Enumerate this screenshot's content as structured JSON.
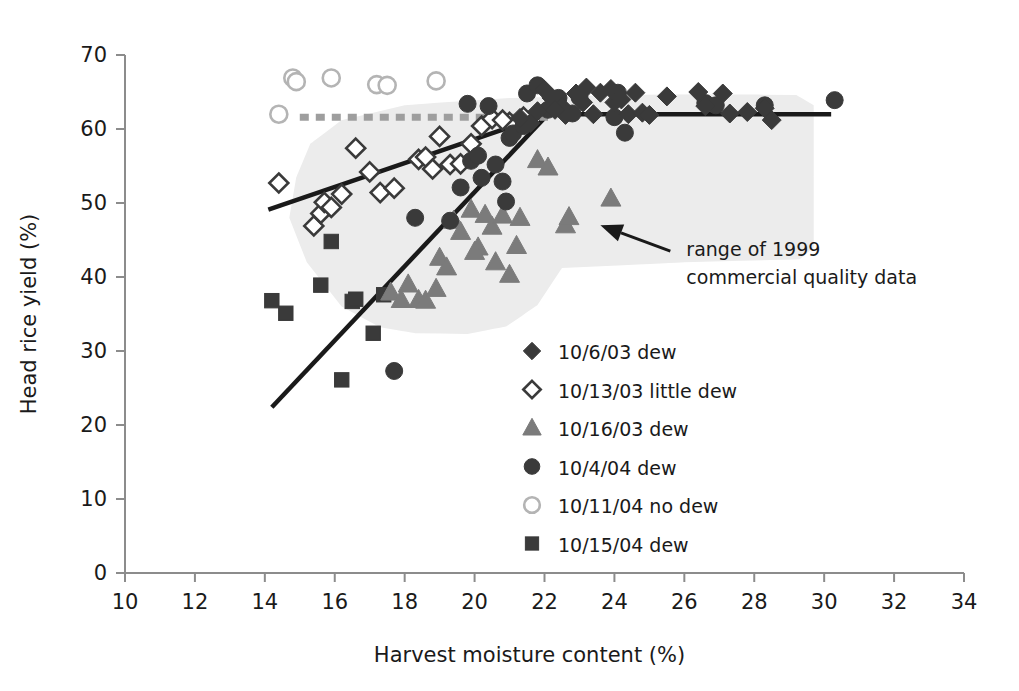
{
  "chart_data": {
    "type": "scatter",
    "title": "",
    "xlabel": "Harvest moisture content (%)",
    "ylabel": "Head rice yield (%)",
    "xlim": [
      10,
      34
    ],
    "ylim": [
      0,
      70
    ],
    "xticks": [
      10,
      12,
      14,
      16,
      18,
      20,
      22,
      24,
      26,
      28,
      30,
      32,
      34
    ],
    "yticks": [
      0,
      10,
      20,
      30,
      40,
      50,
      60,
      70
    ],
    "grid": false,
    "legend_position": "center",
    "colors": {
      "dark_marker": "#3a3a3a",
      "mid_marker": "#7b7b7b",
      "light_outline": "#b4b4b4",
      "open_fill": "#ffffff",
      "shaded_region": "#ececec",
      "trend_line": "#1a1a1a",
      "dashed_line": "#9e9e9e",
      "axis": "#8c8c8c",
      "text": "#1a1a1a"
    },
    "series": [
      {
        "name": "10/6/03 dew",
        "marker": "filled-diamond",
        "color": "#3a3a3a",
        "points": [
          [
            21.6,
            60.8
          ],
          [
            21.8,
            62.4
          ],
          [
            22.0,
            65.3
          ],
          [
            22.2,
            64.2
          ],
          [
            22.5,
            63.0
          ],
          [
            22.6,
            61.9
          ],
          [
            22.9,
            64.8
          ],
          [
            23.1,
            63.6
          ],
          [
            23.4,
            62.0
          ],
          [
            23.6,
            64.9
          ],
          [
            23.9,
            65.4
          ],
          [
            24.0,
            63.6
          ],
          [
            24.2,
            64.0
          ],
          [
            24.4,
            62.0
          ],
          [
            24.6,
            64.9
          ],
          [
            25.5,
            64.4
          ],
          [
            26.4,
            65.0
          ],
          [
            26.6,
            63.1
          ],
          [
            27.1,
            64.8
          ],
          [
            27.3,
            62.1
          ],
          [
            28.3,
            62.8
          ],
          [
            28.5,
            61.2
          ],
          [
            21.3,
            61.5
          ],
          [
            22.3,
            62.6
          ],
          [
            23.2,
            65.6
          ],
          [
            24.8,
            62.2
          ],
          [
            25.0,
            61.9
          ],
          [
            27.8,
            62.3
          ]
        ]
      },
      {
        "name": "10/13/03 little dew",
        "marker": "open-diamond",
        "color": "#3a3a3a",
        "points": [
          [
            14.4,
            52.7
          ],
          [
            15.4,
            46.9
          ],
          [
            15.6,
            48.6
          ],
          [
            15.7,
            50.1
          ],
          [
            15.9,
            49.4
          ],
          [
            16.2,
            51.2
          ],
          [
            16.6,
            57.4
          ],
          [
            17.0,
            54.2
          ],
          [
            17.3,
            51.4
          ],
          [
            17.7,
            52.0
          ],
          [
            18.4,
            55.9
          ],
          [
            18.6,
            56.2
          ],
          [
            18.8,
            54.6
          ],
          [
            19.0,
            59.0
          ],
          [
            19.3,
            55.2
          ],
          [
            19.6,
            55.3
          ],
          [
            20.2,
            60.4
          ],
          [
            20.5,
            61.4
          ],
          [
            21.0,
            60.9
          ],
          [
            21.4,
            61.6
          ],
          [
            19.9,
            58.0
          ],
          [
            20.8,
            61.2
          ]
        ]
      },
      {
        "name": "10/16/03 dew",
        "marker": "filled-triangle",
        "color": "#7b7b7b",
        "points": [
          [
            17.6,
            37.9
          ],
          [
            18.4,
            36.9
          ],
          [
            18.6,
            36.8
          ],
          [
            19.0,
            42.6
          ],
          [
            19.4,
            47.6
          ],
          [
            19.6,
            46.1
          ],
          [
            19.9,
            49.1
          ],
          [
            20.1,
            44.0
          ],
          [
            20.3,
            48.4
          ],
          [
            20.5,
            46.8
          ],
          [
            20.8,
            48.3
          ],
          [
            21.0,
            40.3
          ],
          [
            21.3,
            48.0
          ],
          [
            21.8,
            55.8
          ],
          [
            22.1,
            54.8
          ],
          [
            18.1,
            39.0
          ],
          [
            19.2,
            41.3
          ],
          [
            20.0,
            43.4
          ],
          [
            17.9,
            36.9
          ],
          [
            21.2,
            44.2
          ],
          [
            23.9,
            50.6
          ],
          [
            22.6,
            47.0
          ],
          [
            22.7,
            48.1
          ],
          [
            20.6,
            42.0
          ],
          [
            18.9,
            38.4
          ]
        ]
      },
      {
        "name": "10/4/04 dew",
        "marker": "filled-circle",
        "color": "#3a3a3a",
        "points": [
          [
            17.7,
            27.3
          ],
          [
            18.3,
            48.0
          ],
          [
            19.3,
            47.6
          ],
          [
            19.6,
            52.1
          ],
          [
            19.8,
            63.4
          ],
          [
            19.9,
            55.7
          ],
          [
            20.1,
            56.4
          ],
          [
            20.2,
            53.4
          ],
          [
            20.4,
            63.1
          ],
          [
            20.6,
            55.2
          ],
          [
            20.8,
            52.9
          ],
          [
            21.0,
            58.8
          ],
          [
            21.1,
            59.4
          ],
          [
            21.4,
            60.4
          ],
          [
            21.5,
            64.8
          ],
          [
            21.8,
            65.9
          ],
          [
            22.1,
            62.6
          ],
          [
            22.4,
            64.2
          ],
          [
            23.0,
            64.3
          ],
          [
            24.0,
            61.6
          ],
          [
            24.1,
            64.9
          ],
          [
            26.6,
            63.5
          ],
          [
            26.9,
            63.2
          ],
          [
            28.3,
            63.2
          ],
          [
            30.3,
            63.9
          ],
          [
            20.9,
            50.2
          ],
          [
            22.8,
            62.1
          ],
          [
            24.3,
            59.5
          ]
        ]
      },
      {
        "name": "10/11/04 no dew",
        "marker": "open-circle",
        "color": "#b4b4b4",
        "points": [
          [
            14.4,
            62.0
          ],
          [
            14.8,
            66.9
          ],
          [
            14.9,
            66.4
          ],
          [
            15.9,
            66.9
          ],
          [
            17.2,
            66.0
          ],
          [
            17.5,
            65.9
          ],
          [
            18.9,
            66.5
          ]
        ]
      },
      {
        "name": "10/15/04 dew",
        "marker": "filled-square",
        "color": "#3a3a3a",
        "points": [
          [
            14.2,
            36.8
          ],
          [
            14.6,
            35.1
          ],
          [
            15.6,
            38.9
          ],
          [
            15.9,
            44.8
          ],
          [
            16.2,
            26.1
          ],
          [
            16.5,
            36.7
          ],
          [
            16.6,
            37.0
          ],
          [
            17.1,
            32.4
          ],
          [
            17.4,
            37.6
          ]
        ]
      }
    ],
    "trend_lines": [
      {
        "name": "little-dew-trend",
        "style": "solid",
        "color": "#1a1a1a",
        "points": [
          [
            14.1,
            49.1
          ],
          [
            22.1,
            62.0
          ]
        ]
      },
      {
        "name": "dew-trend-rising",
        "style": "solid",
        "color": "#1a1a1a",
        "points": [
          [
            14.2,
            22.4
          ],
          [
            22.1,
            62.0
          ]
        ]
      },
      {
        "name": "plateau",
        "style": "solid",
        "color": "#1a1a1a",
        "points": [
          [
            22.1,
            62.0
          ],
          [
            30.2,
            62.0
          ]
        ]
      },
      {
        "name": "no-dew-plateau-dashed",
        "style": "dashed",
        "color": "#9e9e9e",
        "points": [
          [
            15.0,
            61.6
          ],
          [
            22.1,
            61.6
          ]
        ]
      }
    ],
    "shaded_region": {
      "name": "range of 1999 commercial quality data",
      "color": "#ececec",
      "outline": [
        [
          14.9,
          53.5
        ],
        [
          15.3,
          58.0
        ],
        [
          16.2,
          61.2
        ],
        [
          18.0,
          63.2
        ],
        [
          21.0,
          64.2
        ],
        [
          24.0,
          64.6
        ],
        [
          27.0,
          64.7
        ],
        [
          29.2,
          64.6
        ],
        [
          29.7,
          63.2
        ],
        [
          29.7,
          44.0
        ],
        [
          29.3,
          42.4
        ],
        [
          26.0,
          42.0
        ],
        [
          22.5,
          41.2
        ],
        [
          21.8,
          36.2
        ],
        [
          20.9,
          33.3
        ],
        [
          19.8,
          32.3
        ],
        [
          18.3,
          32.4
        ],
        [
          17.3,
          33.2
        ],
        [
          16.2,
          36.0
        ],
        [
          15.2,
          42.0
        ],
        [
          14.7,
          48.0
        ]
      ]
    },
    "annotation": {
      "text_line1": "range of 1999",
      "text_line2": "commercial quality data",
      "arrow_from": [
        25.6,
        43.5
      ],
      "arrow_to": [
        23.6,
        47.0
      ]
    }
  },
  "legend": {
    "items": [
      {
        "label": "10/6/03 dew",
        "marker": "filled-diamond"
      },
      {
        "label": "10/13/03 little dew",
        "marker": "open-diamond"
      },
      {
        "label": "10/16/03 dew",
        "marker": "filled-triangle"
      },
      {
        "label": "10/4/04 dew",
        "marker": "filled-circle"
      },
      {
        "label": "10/11/04 no dew",
        "marker": "open-circle"
      },
      {
        "label": "10/15/04 dew",
        "marker": "filled-square"
      }
    ]
  }
}
